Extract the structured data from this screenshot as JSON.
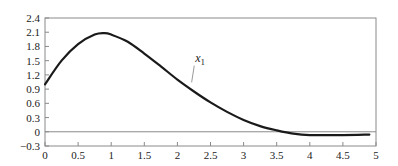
{
  "chart_data": {
    "type": "line",
    "title": "",
    "xlabel": "",
    "ylabel": "",
    "xlim": [
      0,
      5
    ],
    "ylim": [
      -0.3,
      2.4
    ],
    "grid": false,
    "legend": null,
    "x_ticks": [
      0,
      0.5,
      1,
      1.5,
      2,
      2.5,
      3,
      3.5,
      4,
      4.5,
      5
    ],
    "x_tick_labels": [
      "0",
      "0.5",
      "1",
      "1.5",
      "2",
      "2.5",
      "3",
      "3.5",
      "4",
      "4.5",
      "5"
    ],
    "y_ticks": [
      -0.3,
      0,
      0.3,
      0.6,
      0.9,
      1.2,
      1.5,
      1.8,
      2.1,
      2.4
    ],
    "y_tick_labels": [
      "−0.3",
      "0",
      "0.3",
      "0.6",
      "0.9",
      "1.2",
      "1.5",
      "1.8",
      "2.1",
      "2.4"
    ],
    "zero_line": true,
    "series": [
      {
        "name": "x1",
        "label_text": "x",
        "label_subscript": "1",
        "color": "#1a1a1a",
        "x": [
          0,
          0.25,
          0.5,
          0.75,
          0.9,
          1.0,
          1.25,
          1.5,
          1.75,
          2.0,
          2.25,
          2.5,
          2.75,
          3.0,
          3.25,
          3.5,
          3.75,
          4.0,
          4.5,
          4.9
        ],
        "y": [
          1.0,
          1.5,
          1.85,
          2.05,
          2.08,
          2.05,
          1.9,
          1.65,
          1.38,
          1.1,
          0.85,
          0.62,
          0.42,
          0.25,
          0.12,
          0.03,
          -0.04,
          -0.07,
          -0.07,
          -0.06
        ]
      }
    ],
    "annotations": [
      {
        "text": "x1",
        "x": 2.3,
        "y": 1.5,
        "points_to": {
          "x": 2.2,
          "y": 1.0
        }
      }
    ]
  }
}
